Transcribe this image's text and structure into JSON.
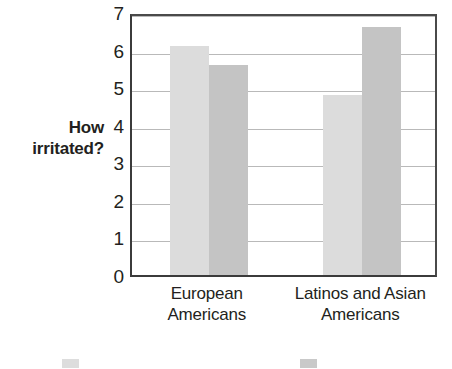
{
  "chart_data": {
    "type": "bar",
    "title": "",
    "subtitle": "",
    "xlabel": "",
    "ylabel": "How irritated?",
    "ylabel_lines": [
      "How",
      "irritated?"
    ],
    "categories": [
      "European Americans",
      "Latinos and Asian Americans"
    ],
    "category_lines": [
      [
        "European",
        "Americans"
      ],
      [
        "Latinos and Asian",
        "Americans"
      ]
    ],
    "series": [
      {
        "name": "Shown an Hispanic",
        "color": "#dcdcdc",
        "values": [
          6.1,
          4.8
        ]
      },
      {
        "name": "Shown a Haralot",
        "color": "#c4c4c4",
        "values": [
          5.6,
          6.6
        ]
      }
    ],
    "ylim": [
      0,
      7
    ],
    "yticks": [
      0,
      1,
      2,
      3,
      4,
      5,
      6,
      7
    ],
    "ytick_labels": [
      "0",
      "1",
      "2",
      "3",
      "4",
      "5",
      "6",
      "7"
    ],
    "grid": true,
    "grid_axis": "y",
    "legend_position": "bottom",
    "legend_clipped": true
  },
  "legend": {
    "items": [
      {
        "label": "",
        "color": "#dddddd"
      },
      {
        "label": "",
        "color": "#c9c9c9"
      }
    ]
  }
}
